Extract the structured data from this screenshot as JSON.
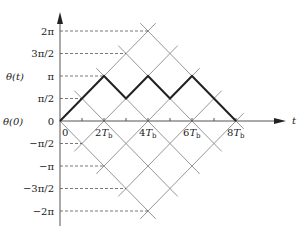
{
  "diagram": {
    "type": "phase-trellis",
    "y_axis": {
      "label": "θ(t)",
      "origin_label": "θ(0)",
      "ticks": [
        {
          "v": 4,
          "label": "2π"
        },
        {
          "v": 3,
          "label": "3π/2"
        },
        {
          "v": 2,
          "label": "π"
        },
        {
          "v": 1,
          "label": "π/2"
        },
        {
          "v": 0,
          "label": "0"
        },
        {
          "v": -1,
          "label": "−π/2"
        },
        {
          "v": -2,
          "label": "−π"
        },
        {
          "v": -3,
          "label": "−3π/2"
        },
        {
          "v": -4,
          "label": "−2π"
        }
      ]
    },
    "x_axis": {
      "label": "t",
      "ticks": [
        {
          "u": 0,
          "label": "0"
        },
        {
          "u": 2,
          "label": "2T",
          "sub": "b"
        },
        {
          "u": 4,
          "label": "4T",
          "sub": "b"
        },
        {
          "u": 6,
          "label": "6T",
          "sub": "b"
        },
        {
          "u": 8,
          "label": "8T",
          "sub": "b"
        }
      ],
      "minor_ticks": [
        1,
        3,
        5,
        7
      ]
    },
    "highlighted_path": [
      [
        0,
        0
      ],
      [
        2,
        2
      ],
      [
        3,
        1
      ],
      [
        4,
        2
      ],
      [
        5,
        1
      ],
      [
        6,
        2
      ],
      [
        8,
        0
      ]
    ],
    "colors": {
      "grid": "#8a8a8a",
      "path": "#222222",
      "axis": "#555555"
    }
  }
}
